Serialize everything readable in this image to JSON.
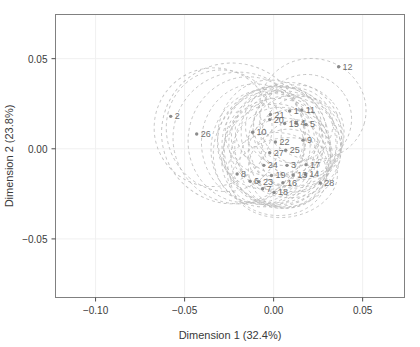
{
  "chart_data": {
    "type": "scatter",
    "title": "",
    "xlabel": "Dimension 1 (32.4%)",
    "ylabel": "Dimension 2 (23.8%)",
    "xlim": [
      -0.1225,
      0.0735
    ],
    "ylim": [
      -0.0825,
      0.0745
    ],
    "xticks": [
      -0.1,
      -0.05,
      0.0,
      0.05
    ],
    "xticklabels": [
      "-0.10",
      "-0.05",
      "0.00",
      "0.05"
    ],
    "yticks": [
      0.05,
      0.0,
      -0.05
    ],
    "yticklabels": [
      "0.05",
      "0.00",
      "-0.05"
    ],
    "grid": true,
    "legend": "none",
    "point_color": "#8c8c8c",
    "ellipse_color": "#b9b9b9",
    "frame_color": "#808080",
    "grid_color": "#f0f0f0",
    "label_color": "#6e6e6e",
    "points": [
      {
        "label": "1",
        "x": 0.009,
        "y": 0.021
      },
      {
        "label": "2",
        "x": -0.0578,
        "y": 0.018
      },
      {
        "label": "3",
        "x": 0.0075,
        "y": -0.0092
      },
      {
        "label": "4",
        "x": 0.0128,
        "y": 0.0142
      },
      {
        "label": "5",
        "x": 0.0182,
        "y": 0.0135
      },
      {
        "label": "6",
        "x": -0.0132,
        "y": -0.018
      },
      {
        "label": "7",
        "x": -0.0062,
        "y": -0.0222
      },
      {
        "label": "8",
        "x": -0.0205,
        "y": -0.014
      },
      {
        "label": "9",
        "x": 0.0165,
        "y": 0.0048
      },
      {
        "label": "10",
        "x": -0.0118,
        "y": 0.0092
      },
      {
        "label": "11",
        "x": 0.0158,
        "y": 0.0215
      },
      {
        "label": "12",
        "x": 0.0365,
        "y": 0.0455
      },
      {
        "label": "13",
        "x": 0.011,
        "y": -0.0145
      },
      {
        "label": "14",
        "x": 0.0178,
        "y": -0.0142
      },
      {
        "label": "15",
        "x": 0.0062,
        "y": 0.014
      },
      {
        "label": "16",
        "x": 0.0052,
        "y": -0.0188
      },
      {
        "label": "17",
        "x": 0.0182,
        "y": -0.0088
      },
      {
        "label": "18",
        "x": 0.0002,
        "y": -0.0242
      },
      {
        "label": "19",
        "x": -0.0012,
        "y": -0.0148
      },
      {
        "label": "20",
        "x": -0.0022,
        "y": 0.0162
      },
      {
        "label": "21",
        "x": -0.0018,
        "y": 0.019
      },
      {
        "label": "22",
        "x": 0.001,
        "y": 0.0038
      },
      {
        "label": "23",
        "x": -0.0082,
        "y": -0.0182
      },
      {
        "label": "24",
        "x": -0.0055,
        "y": -0.0092
      },
      {
        "label": "25",
        "x": 0.0068,
        "y": -0.0008
      },
      {
        "label": "26",
        "x": -0.0432,
        "y": 0.0082
      },
      {
        "label": "27",
        "x": -0.0022,
        "y": -0.0022
      },
      {
        "label": "28",
        "x": 0.0262,
        "y": -0.019
      }
    ],
    "ellipses": [
      {
        "cx": -0.023,
        "cy": 0.0085,
        "rx": 0.04,
        "ry": 0.039,
        "rot": 22
      },
      {
        "cx": -0.0195,
        "cy": 0.006,
        "rx": 0.037,
        "ry": 0.0365,
        "rot": 15
      },
      {
        "cx": -0.015,
        "cy": 0.005,
        "rx": 0.033,
        "ry": 0.035,
        "rot": 8
      },
      {
        "cx": -0.01,
        "cy": 0.003,
        "rx": 0.0305,
        "ry": 0.033,
        "rot": -5
      },
      {
        "cx": -0.006,
        "cy": 0.001,
        "rx": 0.029,
        "ry": 0.032,
        "rot": 12
      },
      {
        "cx": -0.003,
        "cy": 0.0,
        "rx": 0.03,
        "ry": 0.033,
        "rot": 30
      },
      {
        "cx": 0.0,
        "cy": 0.004,
        "rx": 0.031,
        "ry": 0.0345,
        "rot": -18
      },
      {
        "cx": 0.003,
        "cy": 0.002,
        "rx": 0.032,
        "ry": 0.033,
        "rot": 5
      },
      {
        "cx": 0.005,
        "cy": 0.0,
        "rx": 0.033,
        "ry": 0.032,
        "rot": 40
      },
      {
        "cx": 0.002,
        "cy": -0.002,
        "rx": 0.03,
        "ry": 0.03,
        "rot": -30
      },
      {
        "cx": -0.001,
        "cy": 0.006,
        "rx": 0.028,
        "ry": 0.031,
        "rot": 60
      },
      {
        "cx": 0.006,
        "cy": 0.005,
        "rx": 0.029,
        "ry": 0.03,
        "rot": -45
      },
      {
        "cx": 0.008,
        "cy": 0.001,
        "rx": 0.03,
        "ry": 0.028,
        "rot": 18
      },
      {
        "cx": 0.004,
        "cy": -0.005,
        "rx": 0.028,
        "ry": 0.028,
        "rot": -10
      },
      {
        "cx": -0.002,
        "cy": -0.003,
        "rx": 0.026,
        "ry": 0.029,
        "rot": 35
      },
      {
        "cx": 0.01,
        "cy": 0.008,
        "rx": 0.028,
        "ry": 0.029,
        "rot": -25
      },
      {
        "cx": 0.012,
        "cy": 0.004,
        "rx": 0.026,
        "ry": 0.026,
        "rot": 50
      },
      {
        "cx": 0.006,
        "cy": -0.008,
        "rx": 0.025,
        "ry": 0.025,
        "rot": 0
      },
      {
        "cx": 0.0,
        "cy": 0.01,
        "rx": 0.025,
        "ry": 0.027,
        "rot": 70
      },
      {
        "cx": 0.014,
        "cy": 0.01,
        "rx": 0.025,
        "ry": 0.026,
        "rot": -40
      },
      {
        "cx": 0.009,
        "cy": -0.002,
        "rx": 0.023,
        "ry": 0.024,
        "rot": 25
      },
      {
        "cx": 0.003,
        "cy": 0.008,
        "rx": 0.022,
        "ry": 0.025,
        "rot": -60
      },
      {
        "cx": 0.016,
        "cy": 0.006,
        "rx": 0.023,
        "ry": 0.023,
        "rot": 10
      },
      {
        "cx": 0.008,
        "cy": -0.011,
        "rx": 0.022,
        "ry": 0.022,
        "rot": 45
      },
      {
        "cx": -0.004,
        "cy": 0.002,
        "rx": 0.021,
        "ry": 0.023,
        "rot": -15
      },
      {
        "cx": 0.011,
        "cy": 0.013,
        "rx": 0.021,
        "ry": 0.022,
        "rot": 80
      },
      {
        "cx": 0.005,
        "cy": 0.011,
        "rx": 0.02,
        "ry": 0.021,
        "rot": -50
      },
      {
        "cx": 0.013,
        "cy": -0.004,
        "rx": 0.02,
        "ry": 0.02,
        "rot": 20
      },
      {
        "cx": 0.018,
        "cy": 0.016,
        "rx": 0.026,
        "ry": 0.025,
        "rot": -35
      },
      {
        "cx": 0.022,
        "cy": 0.022,
        "rx": 0.03,
        "ry": 0.028,
        "rot": 15
      },
      {
        "cx": -0.034,
        "cy": 0.012,
        "rx": 0.033,
        "ry": 0.033,
        "rot": 30
      },
      {
        "cx": -0.028,
        "cy": 0.01,
        "rx": 0.032,
        "ry": 0.034,
        "rot": -20
      },
      {
        "cx": 0.002,
        "cy": -0.014,
        "rx": 0.028,
        "ry": 0.023,
        "rot": 5
      },
      {
        "cx": 0.006,
        "cy": -0.016,
        "rx": 0.03,
        "ry": 0.022,
        "rot": -8
      }
    ]
  }
}
